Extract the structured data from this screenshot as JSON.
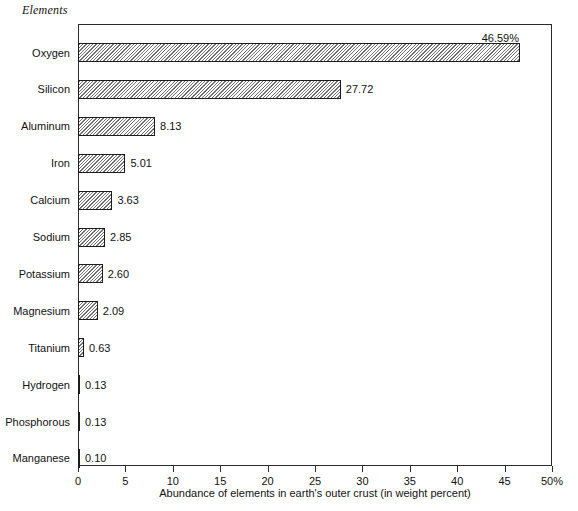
{
  "chart_data": {
    "type": "bar",
    "orientation": "horizontal",
    "title": "",
    "category_axis_title": "Elements",
    "xlabel": "Abundance of elements in earth's outer crust (in weight percent)",
    "ylabel": "Elements",
    "xlim": [
      0,
      50
    ],
    "xticks": [
      0,
      5,
      10,
      15,
      20,
      25,
      30,
      35,
      40,
      45,
      50
    ],
    "xtick_labels": [
      "0",
      "5",
      "10",
      "15",
      "20",
      "25",
      "30",
      "35",
      "40",
      "45",
      "50%"
    ],
    "grid": false,
    "legend": false,
    "categories": [
      "Oxygen",
      "Silicon",
      "Aluminum",
      "Iron",
      "Calcium",
      "Sodium",
      "Potassium",
      "Magnesium",
      "Titanium",
      "Hydrogen",
      "Phosphorous",
      "Manganese"
    ],
    "values": [
      46.59,
      27.72,
      8.13,
      5.01,
      3.63,
      2.85,
      2.6,
      2.09,
      0.63,
      0.13,
      0.13,
      0.1
    ],
    "value_labels": [
      "46.59%",
      "27.72",
      "8.13",
      "5.01",
      "3.63",
      "2.85",
      "2.60",
      "2.09",
      "0.63",
      "0.13",
      "0.13",
      "0.10"
    ],
    "bars": [
      {
        "label": "Oxygen",
        "value": 46.59,
        "value_label": "46.59%",
        "label_position": "above-end"
      },
      {
        "label": "Silicon",
        "value": 27.72,
        "value_label": "27.72",
        "label_position": "right"
      },
      {
        "label": "Aluminum",
        "value": 8.13,
        "value_label": "8.13",
        "label_position": "right"
      },
      {
        "label": "Iron",
        "value": 5.01,
        "value_label": "5.01",
        "label_position": "right"
      },
      {
        "label": "Calcium",
        "value": 3.63,
        "value_label": "3.63",
        "label_position": "right"
      },
      {
        "label": "Sodium",
        "value": 2.85,
        "value_label": "2.85",
        "label_position": "right"
      },
      {
        "label": "Potassium",
        "value": 2.6,
        "value_label": "2.60",
        "label_position": "right"
      },
      {
        "label": "Magnesium",
        "value": 2.09,
        "value_label": "2.09",
        "label_position": "right"
      },
      {
        "label": "Titanium",
        "value": 0.63,
        "value_label": "0.63",
        "label_position": "right"
      },
      {
        "label": "Hydrogen",
        "value": 0.13,
        "value_label": "0.13",
        "label_position": "right"
      },
      {
        "label": "Phosphorous",
        "value": 0.13,
        "value_label": "0.13",
        "label_position": "right"
      },
      {
        "label": "Manganese",
        "value": 0.1,
        "value_label": "0.10",
        "label_position": "right"
      }
    ],
    "colors": {
      "bar_fill": "#ffffff",
      "bar_hatch": "#6f6f6f",
      "bar_border": "#1c1c1c",
      "axis": "#2b2b2b",
      "text": "#111111",
      "background": "#ffffff"
    }
  }
}
